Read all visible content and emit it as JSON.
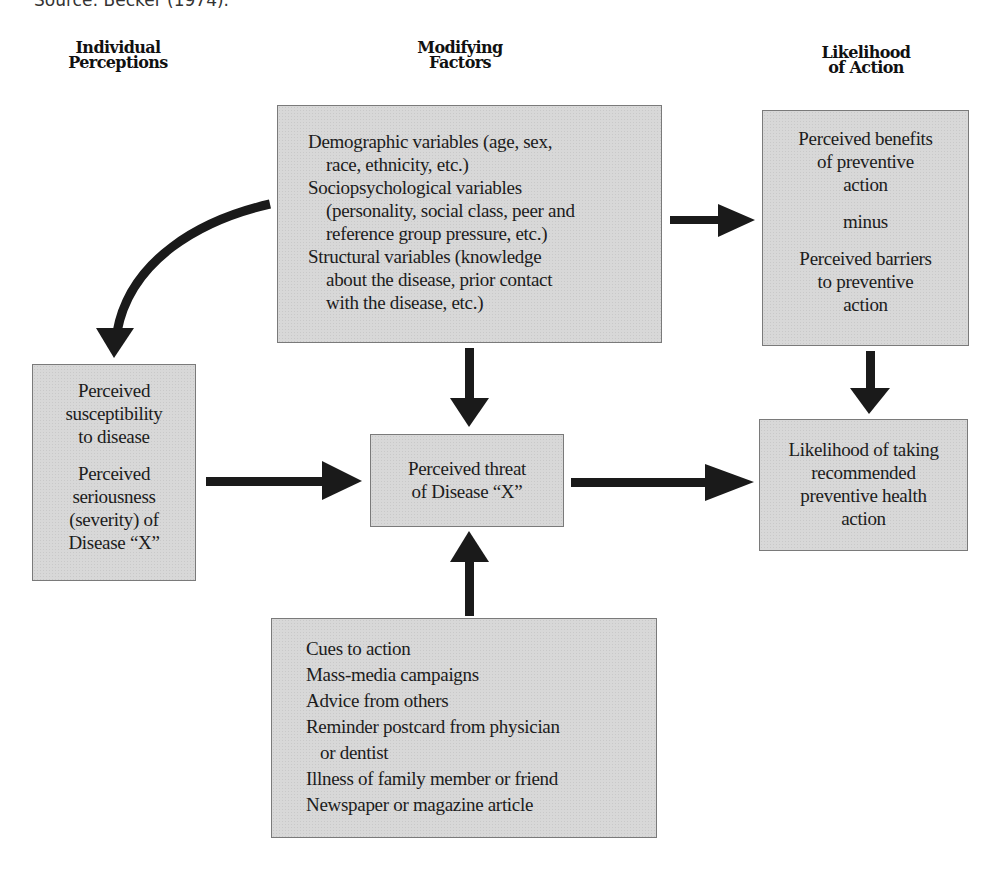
{
  "source_caption": "Source: Becker (1974).",
  "column_headers": {
    "individual": [
      "Individual",
      "Perceptions"
    ],
    "modifying": [
      "Modifying",
      "Factors"
    ],
    "likelihood": [
      "Likelihood",
      "of Action"
    ]
  },
  "boxes": {
    "modifying_factors": {
      "lines": [
        {
          "text": "Demographic variables (age, sex,",
          "indent": false
        },
        {
          "text": "race, ethnicity, etc.)",
          "indent": true
        },
        {
          "text": "Sociopsychological variables",
          "indent": false
        },
        {
          "text": "(personality, social class, peer and",
          "indent": true
        },
        {
          "text": "reference group pressure, etc.)",
          "indent": true
        },
        {
          "text": "Structural variables (knowledge",
          "indent": false
        },
        {
          "text": "about the disease, prior contact",
          "indent": true
        },
        {
          "text": "with the disease, etc.)",
          "indent": true
        }
      ]
    },
    "benefits_barriers": {
      "benefits": [
        "Perceived benefits",
        "of preventive",
        "action"
      ],
      "operator": "minus",
      "barriers": [
        "Perceived barriers",
        "to preventive",
        "action"
      ]
    },
    "individual_perceptions": {
      "susceptibility": [
        "Perceived",
        "susceptibility",
        "to disease"
      ],
      "seriousness": [
        "Perceived",
        "seriousness",
        "(severity) of",
        "Disease “X”"
      ]
    },
    "perceived_threat": {
      "lines": [
        "Perceived threat",
        "of Disease “X”"
      ]
    },
    "likelihood_action": {
      "lines": [
        "Likelihood of taking",
        "recommended",
        "preventive health",
        "action"
      ]
    },
    "cues_to_action": {
      "lines": [
        {
          "text": "Cues to action",
          "indent": false
        },
        {
          "text": "Mass-media campaigns",
          "indent": false
        },
        {
          "text": "Advice from others",
          "indent": false
        },
        {
          "text": "Reminder postcard from physician",
          "indent": false
        },
        {
          "text": "or dentist",
          "indent": true
        },
        {
          "text": "Illness of family member or friend",
          "indent": false
        },
        {
          "text": "Newspaper or magazine article",
          "indent": false
        }
      ]
    }
  },
  "colors": {
    "box_fill": "#d8d8d8",
    "box_border": "#7a7a7a",
    "arrow": "#1a1a1a",
    "text": "#1c1c1c"
  }
}
